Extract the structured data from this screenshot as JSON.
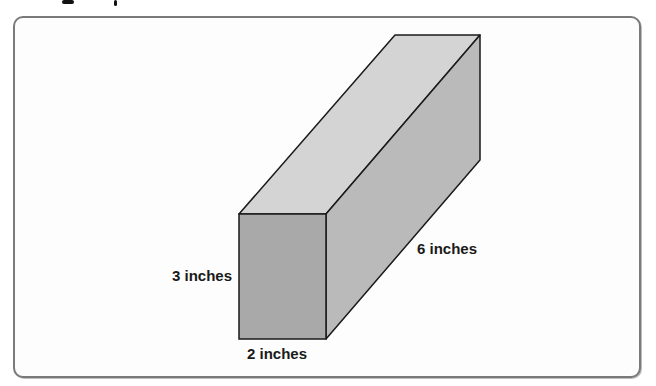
{
  "figure": {
    "labels": {
      "height": "3 inches",
      "width": "2 inches",
      "length": "6 inches"
    },
    "colors": {
      "front_face": "#a9a9a9",
      "top_face": "#d4d4d4",
      "side_face": "#bababa",
      "edge": "#1a1a1a",
      "frame_border": "#7a7a7a"
    }
  }
}
